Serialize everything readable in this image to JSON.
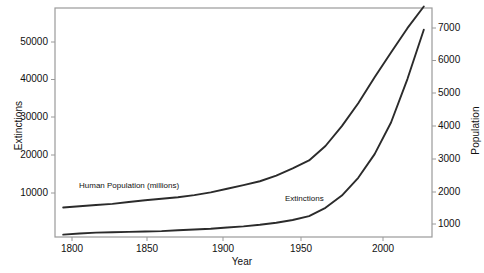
{
  "chart_data": {
    "type": "line",
    "title": "",
    "xlabel": "Year",
    "ylabel": "Extinctions",
    "ylabel_right": "Population",
    "xlim": [
      1795,
      2025
    ],
    "ylim": [
      0,
      58000
    ],
    "ylim_right": [
      0,
      7600
    ],
    "grid": false,
    "legend_position": "inline-annotations",
    "xticks": [
      1800,
      1850,
      1900,
      1950,
      2000
    ],
    "xtick_labels": [
      "1800",
      "1850",
      "1900",
      "1950",
      "2000"
    ],
    "yticks_left": [
      10000,
      20000,
      30000,
      40000,
      50000
    ],
    "ytick_labels_left": [
      "10000",
      "20000",
      "30000",
      "40000",
      "50000"
    ],
    "yticks_right": [
      1000,
      2000,
      3000,
      4000,
      5000,
      6000,
      7000
    ],
    "ytick_labels_right": [
      "1000",
      "2000",
      "3000",
      "4000",
      "5000",
      "6000",
      "7000"
    ],
    "line_color": "#2b2b2b",
    "frame_color": "#9a9a9a",
    "series": [
      {
        "name": "Human Population (millions)",
        "axis": "right",
        "annotation": "Human Population (millions)",
        "x": [
          1800,
          1810,
          1820,
          1830,
          1840,
          1850,
          1860,
          1870,
          1880,
          1890,
          1900,
          1910,
          1920,
          1930,
          1940,
          1950,
          1960,
          1970,
          1980,
          1990,
          2000,
          2010,
          2020
        ],
        "values": [
          980,
          1020,
          1060,
          1100,
          1160,
          1220,
          1270,
          1320,
          1390,
          1480,
          1600,
          1720,
          1850,
          2040,
          2280,
          2540,
          3020,
          3680,
          4440,
          5300,
          6120,
          6930,
          7650
        ]
      },
      {
        "name": "Extinctions",
        "axis": "left",
        "annotation": "Extinctions",
        "x": [
          1800,
          1810,
          1820,
          1830,
          1840,
          1850,
          1860,
          1870,
          1880,
          1890,
          1900,
          1910,
          1920,
          1930,
          1940,
          1950,
          1960,
          1970,
          1980,
          1990,
          2000,
          2010,
          2020
        ],
        "values": [
          600,
          900,
          1100,
          1200,
          1300,
          1400,
          1500,
          1700,
          1900,
          2100,
          2400,
          2700,
          3100,
          3600,
          4300,
          5300,
          7400,
          10500,
          15000,
          21000,
          29000,
          40000,
          52500
        ]
      }
    ],
    "annotations": [
      {
        "text": "Human Population (millions)",
        "x": 1805,
        "y_px": 186
      },
      {
        "text": "Extinctions",
        "x": 1900,
        "y_px": 198
      }
    ]
  }
}
